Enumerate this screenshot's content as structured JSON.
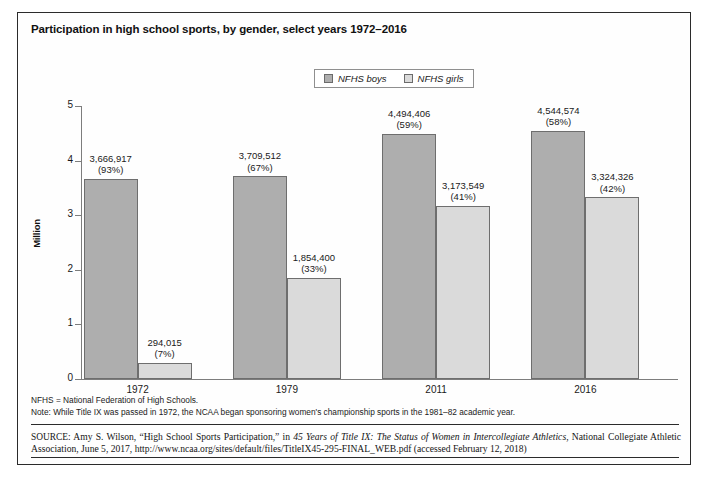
{
  "figure": {
    "title": "Participation in high school sports, by gender, select years 1972–2016",
    "ylabel": "Million",
    "legend": [
      {
        "label": "NFHS boys",
        "color": "#aeaeae"
      },
      {
        "label": "NFHS girls",
        "color": "#dadada"
      }
    ],
    "notes": [
      "NFHS = National Federation of High Schools.",
      "Note: While Title IX was passed in 1972, the NCAA began sponsoring women's championship sports in the 1981–82 academic year."
    ],
    "source_prefix": "SOURCE:",
    "source_part1": " Amy S. Wilson, “High School Sports Participation,” in ",
    "source_italic": "45 Years of Title IX: The Status of Women in Intercollegiate Athletics",
    "source_part2": ", National Collegiate Athletic Association, June 5, 2017, http://www.ncaa.org/sites/default/files/TitleIX45-295-FINAL_WEB.pdf (accessed February 12, 2018)"
  },
  "chart_data": {
    "type": "bar",
    "title": "Participation in high school sports, by gender, select years 1972–2016",
    "xlabel": "",
    "ylabel": "Million",
    "ylim": [
      0,
      5
    ],
    "yticks": [
      "0",
      "1",
      "2",
      "3",
      "4",
      "5"
    ],
    "grid": false,
    "legend_position": "top-center",
    "categories": [
      "1972",
      "1979",
      "2011",
      "2016"
    ],
    "series": [
      {
        "name": "NFHS boys",
        "color": "#aeaeae",
        "values": [
          3666917,
          3709512,
          4494406,
          4544574
        ],
        "value_labels": [
          "3,666,917",
          "3,709,512",
          "4,494,406",
          "4,544,574"
        ],
        "percent_labels": [
          "(93%)",
          "(67%)",
          "(59%)",
          "(58%)"
        ]
      },
      {
        "name": "NFHS girls",
        "color": "#dadada",
        "values": [
          294015,
          1854400,
          3173549,
          3324326
        ],
        "value_labels": [
          "294,015",
          "1,854,400",
          "3,173,549",
          "3,324,326"
        ],
        "percent_labels": [
          "(7%)",
          "(33%)",
          "(41%)",
          "(42%)"
        ]
      }
    ]
  }
}
